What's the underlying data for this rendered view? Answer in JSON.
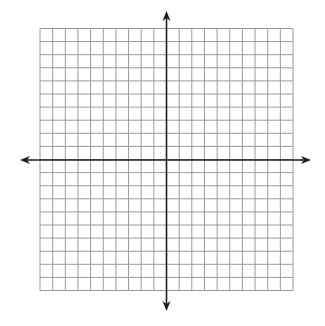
{
  "graph": {
    "type": "coordinate-grid",
    "columns": 20,
    "rows": 20,
    "grid_left": 40,
    "grid_top": 28.5,
    "grid_right": 293,
    "grid_bottom": 290.5,
    "x_axis_y": 160,
    "y_axis_x": 166.5,
    "x_axis_extent": [
      20,
      311
    ],
    "y_axis_extent": [
      11,
      311
    ],
    "colors": {
      "background": "#ffffff",
      "grid_line": "#9a9a9a",
      "axis": "#1e1e1e"
    },
    "labels": []
  }
}
